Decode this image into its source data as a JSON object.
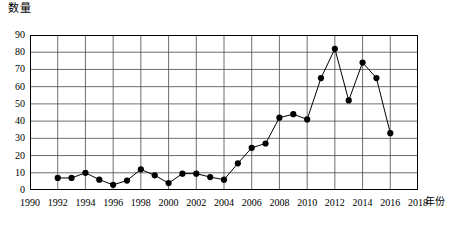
{
  "chart_data": {
    "type": "line",
    "title": "",
    "subtitle": "",
    "xlabel": "年份",
    "ylabel": "数量",
    "xlim": [
      1990,
      2018
    ],
    "ylim": [
      0,
      90
    ],
    "ytick_step": 10,
    "xtick_step": 2,
    "grid": true,
    "legend": null,
    "legend_position": "none",
    "marker": "filled-circle",
    "line_color": "#000000",
    "marker_color": "#000000",
    "grid_color": "#4a4a4a",
    "axis_color": "#000000",
    "background": "#ffffff",
    "y_ticks": [
      0,
      10,
      20,
      30,
      40,
      50,
      60,
      70,
      80,
      90
    ],
    "x_ticks": [
      1990,
      1992,
      1994,
      1996,
      1998,
      2000,
      2002,
      2004,
      2006,
      2008,
      2010,
      2012,
      2014,
      2016,
      2018
    ],
    "x": [
      1992,
      1993,
      1994,
      1995,
      1996,
      1997,
      1998,
      1999,
      2000,
      2001,
      2002,
      2003,
      2004,
      2005,
      2006,
      2007,
      2008,
      2009,
      2010,
      2011,
      2012,
      2013,
      2014,
      2015,
      2016
    ],
    "values": [
      7,
      7,
      10,
      6,
      3,
      5.5,
      12,
      8.5,
      4,
      9.5,
      9.5,
      7.5,
      6,
      15.5,
      24.5,
      27,
      42,
      44,
      41,
      65,
      82,
      52,
      74,
      65,
      33
    ],
    "series": [
      {
        "name": "数量",
        "x": [
          1992,
          1993,
          1994,
          1995,
          1996,
          1997,
          1998,
          1999,
          2000,
          2001,
          2002,
          2003,
          2004,
          2005,
          2006,
          2007,
          2008,
          2009,
          2010,
          2011,
          2012,
          2013,
          2014,
          2015,
          2016
        ],
        "values": [
          7,
          7,
          10,
          6,
          3,
          5.5,
          12,
          8.5,
          4,
          9.5,
          9.5,
          7.5,
          6,
          15.5,
          24.5,
          27,
          42,
          44,
          41,
          65,
          82,
          52,
          74,
          65,
          33
        ]
      }
    ],
    "annotations": []
  }
}
